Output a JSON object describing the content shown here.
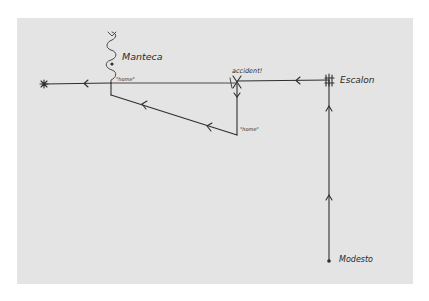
{
  "diagram": {
    "type": "hand-drawn route map",
    "paper_color": "#e4e4e4",
    "ink_color": "#2e2e2e",
    "labels": {
      "manteca": "Manteca",
      "accident": "accident!",
      "escalon": "Escalon",
      "modesto": "Modesto",
      "home_1": "\"home\"",
      "home_2": "\"home\""
    },
    "nodes": [
      {
        "id": "star",
        "label": "",
        "x": 44,
        "y": 84,
        "marker": "star"
      },
      {
        "id": "manteca-junction",
        "label": "Manteca",
        "x": 111,
        "y": 83,
        "marker": "none"
      },
      {
        "id": "accident",
        "label": "accident!",
        "x": 237,
        "y": 83,
        "marker": "cross"
      },
      {
        "id": "home-bottom",
        "label": "\"home\"",
        "x": 237,
        "y": 135,
        "marker": "none"
      },
      {
        "id": "escalon",
        "label": "Escalon",
        "x": 329,
        "y": 83,
        "marker": "scribble"
      },
      {
        "id": "modesto",
        "label": "Modesto",
        "x": 329,
        "y": 260,
        "marker": "dot"
      }
    ],
    "edges": [
      {
        "from": "modesto",
        "to": "escalon",
        "direction": "up",
        "arrows": 2
      },
      {
        "from": "escalon",
        "to": "accident",
        "direction": "left",
        "arrows": 1
      },
      {
        "from": "accident",
        "to": "home-bottom",
        "direction": "down",
        "arrows": 1
      },
      {
        "from": "home-bottom",
        "to": "manteca-junction",
        "direction": "up-left",
        "arrows": 2
      },
      {
        "from": "manteca-junction",
        "to": "star",
        "direction": "left",
        "arrows": 1
      }
    ]
  }
}
